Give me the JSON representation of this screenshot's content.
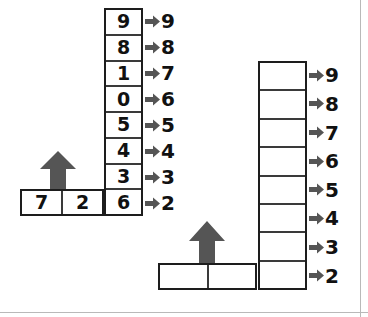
{
  "diagram": {
    "colors": {
      "arrow_fill": "#555555",
      "cell_border": "#1d1d1d",
      "divider": "#3a3a3a",
      "text": "#111111",
      "background": "#ffffff"
    },
    "left_group": {
      "name": "worked-example",
      "column_cells": [
        "9",
        "8",
        "1",
        "0",
        "5",
        "4",
        "3",
        "6"
      ],
      "column_labels": [
        "9",
        "8",
        "7",
        "6",
        "5",
        "4",
        "3",
        "2"
      ],
      "bottom_cells": [
        "7",
        "2"
      ],
      "up_arrow": "up-arrow"
    },
    "right_group": {
      "name": "blank-exercise",
      "column_cells": [
        "",
        "",
        "",
        "",
        "",
        "",
        "",
        ""
      ],
      "column_labels": [
        "9",
        "8",
        "7",
        "6",
        "5",
        "4",
        "3",
        "2"
      ],
      "bottom_cells": [
        "",
        ""
      ],
      "up_arrow": "up-arrow"
    }
  }
}
